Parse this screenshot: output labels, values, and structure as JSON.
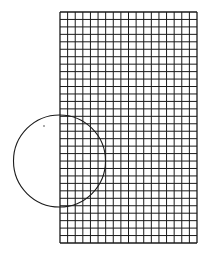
{
  "diagram": {
    "type": "geometry",
    "stroke_color": "#1a1a1a",
    "background": "#ffffff",
    "grid": {
      "x": 60,
      "y": 12,
      "width": 137,
      "height": 231,
      "columns": 18,
      "rows": 31
    },
    "circle": {
      "cx": 59.5,
      "cy": 161,
      "r": 46
    },
    "dot": {
      "x": 44,
      "y": 126
    }
  }
}
